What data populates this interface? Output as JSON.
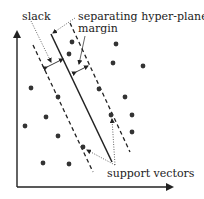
{
  "diagram": {
    "labels": {
      "slack": "slack",
      "hyperplane": "separating hyper-plane",
      "margin": "margin",
      "support_vectors": "support vectors"
    },
    "colors": {
      "ink": "#222222",
      "point": "#333333",
      "point_light": "#555555"
    },
    "points": [
      {
        "x": 72,
        "y": 42
      },
      {
        "x": 116,
        "y": 44
      },
      {
        "x": 69,
        "y": 54
      },
      {
        "x": 113,
        "y": 63
      },
      {
        "x": 143,
        "y": 66
      },
      {
        "x": 31,
        "y": 88
      },
      {
        "x": 58,
        "y": 97
      },
      {
        "x": 99,
        "y": 89
      },
      {
        "x": 125,
        "y": 97
      },
      {
        "x": 25,
        "y": 126
      },
      {
        "x": 46,
        "y": 117
      },
      {
        "x": 111,
        "y": 115
      },
      {
        "x": 132,
        "y": 115
      },
      {
        "x": 58,
        "y": 136
      },
      {
        "x": 132,
        "y": 132
      },
      {
        "x": 83,
        "y": 147
      },
      {
        "x": 43,
        "y": 163
      },
      {
        "x": 69,
        "y": 164
      }
    ]
  }
}
